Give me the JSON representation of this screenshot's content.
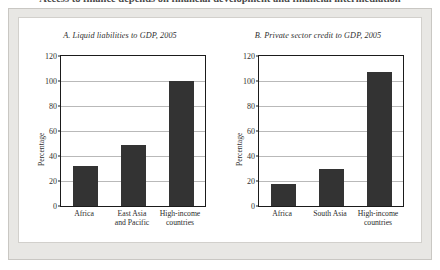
{
  "figure": {
    "title": "Access to finance depends on financial development and financial intermediation"
  },
  "chart_data": [
    {
      "type": "bar",
      "panel_id": "A",
      "title": "A. Liquid liabilities to GDP, 2005",
      "categories": [
        "Africa",
        "East Asia\nand Pacific",
        "High-income\ncountries"
      ],
      "values": [
        32,
        49,
        100
      ],
      "xlabel": "",
      "ylabel": "Percentage",
      "ylim": [
        0,
        120
      ],
      "yticks": [
        0,
        20,
        40,
        60,
        80,
        100,
        120
      ],
      "grid": true,
      "legend": "none",
      "bar_color": "#333333"
    },
    {
      "type": "bar",
      "panel_id": "B",
      "title": "B. Private sector credit to GDP, 2005",
      "categories": [
        "Africa",
        "South Asia",
        "High-income\ncountries"
      ],
      "values": [
        18,
        30,
        107
      ],
      "xlabel": "",
      "ylabel": "Percentage",
      "ylim": [
        0,
        120
      ],
      "yticks": [
        0,
        20,
        40,
        60,
        80,
        100,
        120
      ],
      "grid": true,
      "legend": "none",
      "bar_color": "#333333"
    }
  ]
}
